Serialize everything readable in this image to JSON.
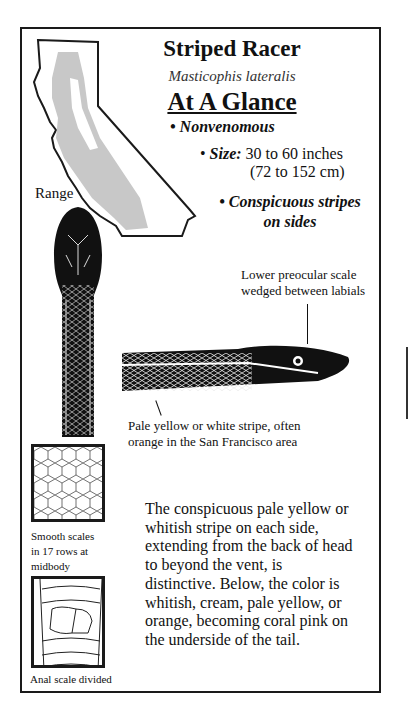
{
  "title": "Striped Racer",
  "scientific_name": "Masticophis lateralis",
  "section_heading": "At A Glance",
  "bullets": [
    {
      "label": "Nonvenomous"
    },
    {
      "label": "Size:",
      "value_line1": "30 to 60 inches",
      "value_line2": "(72 to 152 cm)"
    },
    {
      "label_line1": "Conspicuous stripes",
      "label_line2": "on sides"
    }
  ],
  "bullet_char": "•",
  "map_label": "Range",
  "captions": {
    "preocular_line1": "Lower preocular scale",
    "preocular_line2": "wedged between labials",
    "stripe_line1": "Pale yellow or white stripe, often",
    "stripe_line2": "orange in the San Francisco area",
    "scales_line1": "Smooth scales",
    "scales_line2": "in 17 rows at",
    "scales_line3": "midbody",
    "anal": "Anal scale divided"
  },
  "description": "The conspicuous pale yellow or whitish stripe on each side, extending from the back of head to beyond the vent, is distinctive. Below, the color is whitish, cream, pale yellow, or orange, becoming coral pink on the underside of the tail.",
  "colors": {
    "ink": "#1a1a1a",
    "range_shade": "#c8c8c8"
  }
}
